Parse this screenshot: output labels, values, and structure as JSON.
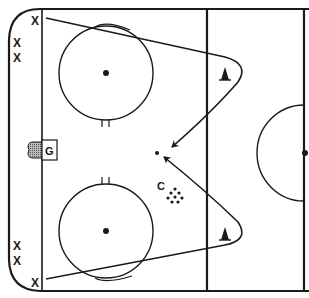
{
  "diagram": {
    "type": "hockey-drill",
    "players": {
      "forward_top": "X",
      "waiting_top_1": "X",
      "waiting_top_2": "X",
      "waiting_bottom_1": "X",
      "waiting_bottom_2": "X",
      "forward_bottom": "X"
    },
    "goalie": "G",
    "coach": "C",
    "colors": {
      "line": "#1a1a1a",
      "background": "#ffffff",
      "net_fill": "#888888"
    },
    "elements": [
      "rink-boards",
      "goal-line",
      "blue-line",
      "center-line",
      "faceoff-circle-top",
      "faceoff-circle-bottom",
      "center-circle-half",
      "goal-crease",
      "net",
      "cone-top",
      "cone-bottom",
      "puck-pile",
      "skating-path-top",
      "skating-path-bottom",
      "pass-target-puck"
    ]
  }
}
